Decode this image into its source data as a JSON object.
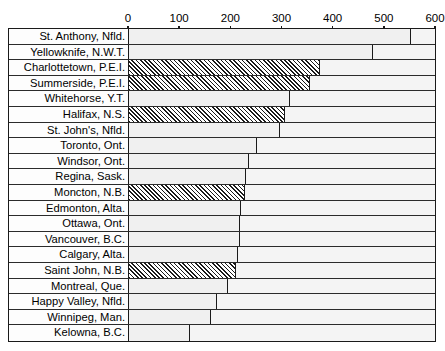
{
  "chart_data": {
    "type": "bar",
    "orientation": "horizontal",
    "title": "",
    "xlabel": "",
    "ylabel": "",
    "xlim": [
      0,
      600
    ],
    "grid": true,
    "legend": "none",
    "tick_labels": [
      "0",
      "100",
      "200",
      "300",
      "400",
      "500",
      "600"
    ],
    "ticks": [
      0,
      100,
      200,
      300,
      400,
      500,
      600
    ],
    "categories": [
      "St. Anthony, Nfld.",
      "Yellowknife, N.W.T.",
      "Charlottetown, P.E.I.",
      "Summerside, P.E.I.",
      "Whitehorse, Y.T.",
      "Halifax, N.S.",
      "St. John's, Nfld.",
      "Toronto, Ont.",
      "Windsor, Ont.",
      "Regina, Sask.",
      "Moncton, N.B.",
      "Edmonton, Alta.",
      "Ottawa, Ont.",
      "Vancouver, B.C.",
      "Calgary, Alta.",
      "Saint John, N.B.",
      "Montreal, Que.",
      "Happy Valley, Nfld.",
      "Winnipeg, Man.",
      "Kelowna, B.C."
    ],
    "values": [
      555,
      480,
      377,
      357,
      318,
      307,
      299,
      254,
      238,
      231,
      229,
      221,
      220,
      219,
      215,
      213,
      196,
      174,
      164,
      123
    ],
    "highlighted": [
      "Charlottetown, P.E.I.",
      "Summerside, P.E.I.",
      "Halifax, N.S.",
      "Moncton, N.B.",
      "Saint John, N.B."
    ],
    "colors": {
      "bar_fill": "#f0f0f0",
      "bar_outline": "#1a1a1a",
      "hatch": "#1a1a1a",
      "plot_background": "#f4f4f4",
      "grid_line": "#2b2b2b"
    }
  }
}
